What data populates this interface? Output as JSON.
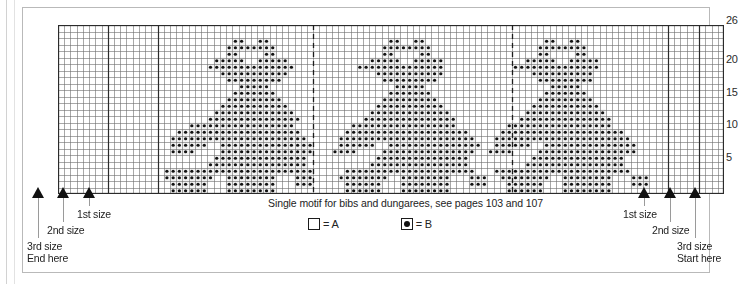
{
  "chart_data": {
    "type": "heatmap",
    "title": "Single motif for bibs and dungarees, see pages 103 and 107",
    "grid": {
      "columns": 107,
      "rows": 26,
      "row_label_side": "right",
      "row_ticks": [
        26,
        20,
        15,
        10,
        5
      ],
      "symbols": {
        "A": "empty-square",
        "B": "dotted-square"
      }
    },
    "major_gridline_columns": [
      8,
      16,
      41,
      73,
      98,
      103
    ],
    "dashed_gridline_columns": [
      41,
      73
    ],
    "xlabel": "stitches",
    "ylabel": "rows",
    "legend": [
      {
        "symbol": "A",
        "swatch": "empty",
        "label": "= A"
      },
      {
        "symbol": "B",
        "swatch": "filled",
        "label": "= B"
      }
    ],
    "motif_description": "Teddy bear motif repeated three times across the chart",
    "pattern_rows": [
      "00000000000000000000000000000000000000000000000000000000000000000000000000000000000000000000000000000000000",
      "00000000000000000000000000000000000000000000000000000000000000000000000000000000000000000000000000000000000",
      "00000000000000000000000000001100110000000000000000000110011000000000000000000011001100000000000000000000000",
      "00000000000000000000000000011111111000000000000000001111111100000000000000000111111110000000000000000000000",
      "00000000000000000000000000011000011000000000000000001100001100000000000000000110000110000000000000000000000",
      "00000000000000000000000001111100111110000000000000111110011111000000000000011111001111100000000000000000000",
      "00000000000000000000000011111111111111000000000011111111111111000000000001111111111111100000000000000000000",
      "00000000000000000000000000111111111110000000000000011111111111000000000000001111111111000000000000000000000",
      "00000000000000000000000000011111111100000000000000001111111110000000000000000111111111000000000000000000000",
      "00000000000000000000000000000111110000000000000000000011111000000000000000000001111100000000000000000000000",
      "00000000000000000000000000001111111000000000000000000111111100000000000000000011111110000000000000000000000",
      "00000000000000000000000000011111111100000000000000001111111110000000000000000111111111000000000000000000000",
      "00000000000000000000000000111111111110000000000000011111111111000000000000001111111111100000000000000000000",
      "00000000000000000000000001111111111111000000000000111111111111100000000000011111111111110000000000000000000",
      "00000000000000000000000011111111111111100000000001111111111111110000000000111111111111111000000000000000000",
      "00000000000000000000011111111111111111000000000111111111111111110000000011111111111111111000000000000000000",
      "00000000000000000001111111111111111111100000001111111111111111111100000111111111111111111110000000000000000",
      "00000000000000000011111111111111111111110000011111111111111111111110001111111111111111111111000000000000000",
      "00000000000000000011111100111111111111111000011111100111111111111111001111110011111111111111100000000000000",
      "00000000000000000011110000111111111111111000111100001111111111111110011110000111111111111111100000000000000",
      "00000000000000000000000001111111111111110000000000011111111111111100000000001111111111111110000000000000000",
      "00000000000000000000000011111111111111110000000000111111111111111100000000011111111111111110000000000000000",
      "00000000000000000111111111111111111111111000001111111111111111111110001111111111111111111111000000000000000",
      "00000000000000000111111110011111111000111000011111111001111111100011100111111110011111111000111000000000000",
      "00000000000000000011111100011111111000111000001111110001111111100011100011111100011111111000111000000000000",
      "00000000000000000011111100011111111000000000001111110001111111100000000011111100011111111000000000000000000"
    ]
  },
  "markers": {
    "left": [
      {
        "name": "3rd size",
        "secondary": "End here",
        "x": 37,
        "label_x": 26,
        "label_y": 239,
        "stem": 40
      },
      {
        "name": "2nd size",
        "secondary": "",
        "x": 62,
        "label_x": 46,
        "label_y": 223,
        "stem": 24
      },
      {
        "name": "1st size",
        "secondary": "",
        "x": 88,
        "label_x": 76,
        "label_y": 207,
        "stem": 8
      }
    ],
    "right": [
      {
        "name": "1st size",
        "secondary": "",
        "x": 643,
        "label_x": 622,
        "label_y": 207,
        "stem": 8
      },
      {
        "name": "2nd size",
        "secondary": "",
        "x": 669,
        "label_x": 651,
        "label_y": 223,
        "stem": 24
      },
      {
        "name": "3rd size",
        "secondary": "Start here",
        "x": 694,
        "label_x": 676,
        "label_y": 239,
        "stem": 40
      }
    ]
  },
  "caption": {
    "text": "Single motif for bibs and dungarees, see pages 103 and 107"
  },
  "key": {
    "item_a": "= A",
    "item_b": "= B"
  },
  "colors": {
    "grid_line": "#6d6d6d",
    "major_line": "#2b2b2b",
    "symbol_fill": "#111111",
    "symbol_bg": "#f2f2f2",
    "background": "#ffffff"
  }
}
